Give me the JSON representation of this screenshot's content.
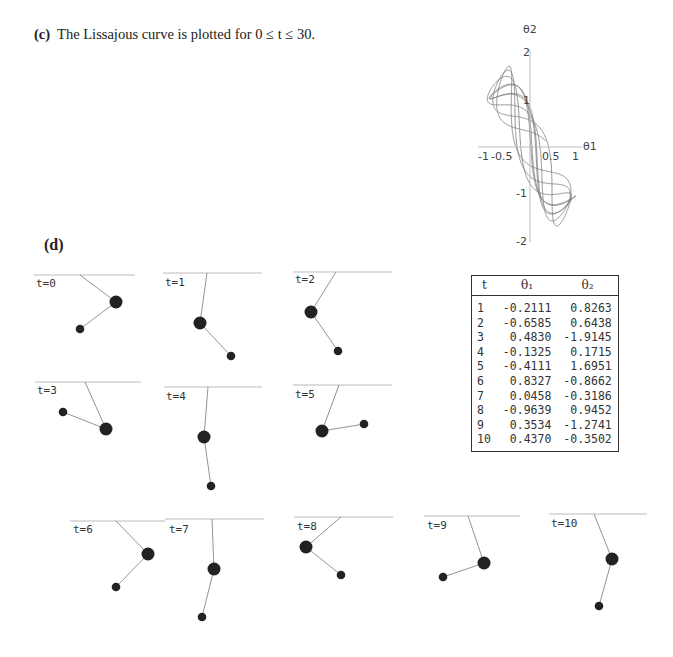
{
  "caption": {
    "label": "(c)",
    "text": "The Lissajous curve is plotted for 0 ≤ t ≤ 30."
  },
  "part_d": {
    "label": "(d)"
  },
  "chart_data": {
    "type": "line",
    "xlabel": "θ1",
    "ylabel": "θ2",
    "xlim": [
      -1,
      1
    ],
    "ylim": [
      -2,
      2
    ],
    "xticks": [
      "-1",
      "-0.5",
      "0.5",
      "1"
    ],
    "yticks": [
      "2",
      "1",
      "-1",
      "-2"
    ],
    "grid": false
  },
  "lissajous": {
    "xlabel": "θ1",
    "ylabel": "θ2",
    "xticks": [
      "-1",
      "-0.5",
      "0.5",
      "1"
    ],
    "yticks": [
      "2",
      "1",
      "-1",
      "-2"
    ]
  },
  "table": {
    "headers": [
      "t",
      "θ₁",
      "θ₂"
    ],
    "rows": [
      [
        "1",
        "-0.2111",
        "0.8263"
      ],
      [
        "2",
        "-0.6585",
        "0.6438"
      ],
      [
        "3",
        "0.4830",
        "-1.9145"
      ],
      [
        "4",
        "-0.1325",
        "0.1715"
      ],
      [
        "5",
        "-0.4111",
        "1.6951"
      ],
      [
        "6",
        "0.8327",
        "-0.8662"
      ],
      [
        "7",
        "0.0458",
        "-0.3186"
      ],
      [
        "8",
        "-0.9639",
        "0.9452"
      ],
      [
        "9",
        "0.3534",
        "-1.2741"
      ],
      [
        "10",
        "0.4370",
        "-0.3502"
      ]
    ]
  },
  "frames": [
    {
      "label": "t=0"
    },
    {
      "label": "t=1"
    },
    {
      "label": "t=2"
    },
    {
      "label": "t=3"
    },
    {
      "label": "t=4"
    },
    {
      "label": "t=5"
    },
    {
      "label": "t=6"
    },
    {
      "label": "t=7"
    },
    {
      "label": "t=8"
    },
    {
      "label": "t=9"
    },
    {
      "label": "t=10"
    }
  ],
  "colors": {
    "ink": "#222222",
    "curve": "#777777",
    "axis": "#aaaaaa"
  }
}
